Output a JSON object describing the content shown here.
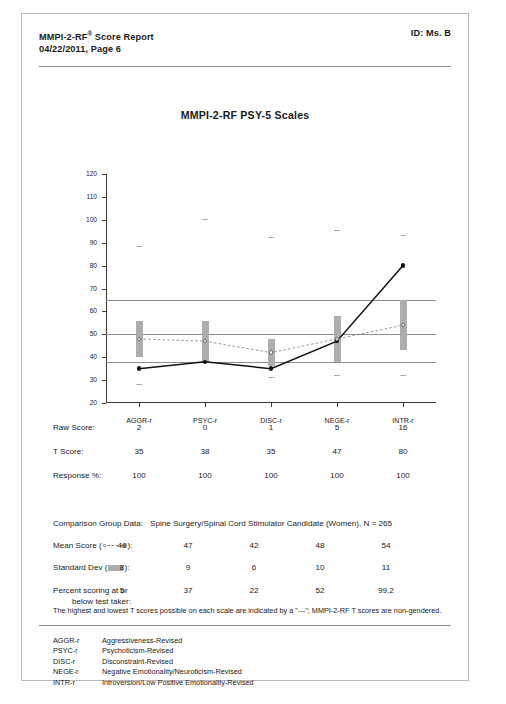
{
  "header": {
    "title_line1": "MMPI-2-RF",
    "title_sup": "®",
    "title_line1_rest": " Score Report",
    "title_line2": "04/22/2011, Page 6",
    "id_label": "ID: Ms. B"
  },
  "chart_title": "MMPI-2-RF PSY-5 Scales",
  "chart_data": {
    "type": "line",
    "title": "MMPI-2-RF PSY-5 Scales",
    "xlabel": "",
    "ylabel": "",
    "ylim": [
      20,
      120
    ],
    "yticks": [
      120,
      110,
      100,
      90,
      80,
      70,
      60,
      50,
      40,
      30,
      20
    ],
    "grid": false,
    "reference_lines": [
      65,
      50,
      38
    ],
    "categories": [
      "AGGR-r",
      "PSYC-r",
      "DISC-r",
      "NEGE-r",
      "INTR-r"
    ],
    "series": [
      {
        "name": "T Score",
        "style": "solid-filled-circle",
        "values": [
          35,
          38,
          35,
          47,
          80
        ]
      },
      {
        "name": "Mean Score",
        "style": "dashed-open-circle",
        "values": [
          48,
          47,
          42,
          48,
          54
        ]
      }
    ],
    "sd_bars": {
      "name": "Standard Dev (±1 SD)",
      "color": "#adadad",
      "low": [
        40,
        38,
        36,
        38,
        43
      ],
      "high": [
        56,
        56,
        48,
        58,
        65
      ]
    },
    "limit_markers": {
      "label": "---",
      "high": [
        88,
        100,
        92,
        95,
        93
      ],
      "low": [
        28,
        null,
        31,
        32,
        32
      ]
    }
  },
  "table": {
    "columns": [
      "AGGR-r",
      "PSYC-r",
      "DISC-r",
      "NEGE-r",
      "INTR-r"
    ],
    "rows": [
      {
        "label": "Raw Score:",
        "values": [
          "2",
          "0",
          "1",
          "5",
          "16"
        ]
      },
      {
        "label": "T Score:",
        "values": [
          "35",
          "38",
          "35",
          "47",
          "80"
        ]
      },
      {
        "label": "Response %:",
        "values": [
          "100",
          "100",
          "100",
          "100",
          "100"
        ]
      }
    ]
  },
  "comparison": {
    "group_label": "Comparison Group Data:",
    "group_value": "Spine Surgery/Spinal Cord Stimulator Candidate (Women), N = 265",
    "mean_label_pre": "Mean Score  (",
    "mean_label_post": "):",
    "mean_values": [
      "48",
      "47",
      "42",
      "48",
      "54"
    ],
    "sd_label_pre": "Standard Dev (",
    "sd_label_post": "):",
    "sd_values": [
      "8",
      "9",
      "6",
      "10",
      "11"
    ],
    "pct_label_line1": "Percent scoring at or",
    "pct_label_line2": "below test taker:",
    "pct_values": [
      "5",
      "37",
      "22",
      "52",
      "99.2"
    ]
  },
  "note": "The highest and lowest T scores possible on each scale are indicated by a \"---\"; MMPI-2-RF T scores are non-gendered.",
  "abbreviations": [
    {
      "key": "AGGR-r",
      "value": "Aggressiveness-Revised"
    },
    {
      "key": "PSYC-r",
      "value": "Psychoticism-Revised"
    },
    {
      "key": "DISC-r",
      "value": "Disconstraint-Revised"
    },
    {
      "key": "NEGE-r",
      "value": "Negative Emotionality/Neuroticism-Revised"
    },
    {
      "key": "INTR-r",
      "value": "Introversion/Low Positive Emotionality-Revised"
    }
  ],
  "caption": "",
  "colors": {
    "sd_bar": "#adadad",
    "reference_line": "#8e8e8e",
    "axis": "#3a3a3a"
  }
}
